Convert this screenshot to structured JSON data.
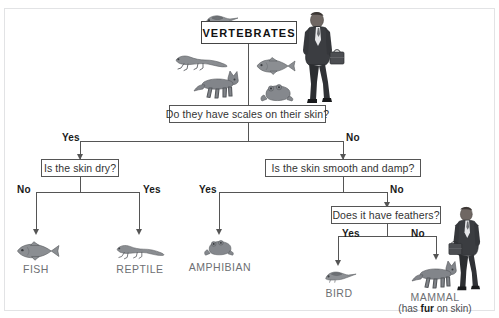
{
  "page": {
    "top_cut_text": "",
    "background_color": "#ffffff",
    "frame_color": "#e2e3e5"
  },
  "diagram": {
    "type": "decision-tree",
    "root": {
      "label": "VERTEBRATES"
    },
    "questions": [
      {
        "id": "q-scales",
        "text": "Do they have scales on their skin?"
      },
      {
        "id": "q-dry",
        "text": "Is the skin dry?"
      },
      {
        "id": "q-smooth",
        "text": "Is the skin smooth and damp?"
      },
      {
        "id": "q-feathers",
        "text": "Does it have feathers?"
      }
    ],
    "edges": [
      {
        "id": "e-scales-yes",
        "label": "Yes",
        "from": "q-scales",
        "to": "q-dry"
      },
      {
        "id": "e-scales-no",
        "label": "No",
        "from": "q-scales",
        "to": "q-smooth"
      },
      {
        "id": "e-dry-no",
        "label": "No",
        "from": "q-dry",
        "to": "leaf-fish"
      },
      {
        "id": "e-dry-yes",
        "label": "Yes",
        "from": "q-dry",
        "to": "leaf-reptile"
      },
      {
        "id": "e-smooth-yes",
        "label": "Yes",
        "from": "q-smooth",
        "to": "leaf-amphibian"
      },
      {
        "id": "e-smooth-no",
        "label": "No",
        "from": "q-smooth",
        "to": "q-feathers"
      },
      {
        "id": "e-feathers-yes",
        "label": "Yes",
        "from": "q-feathers",
        "to": "leaf-bird"
      },
      {
        "id": "e-feathers-no",
        "label": "No",
        "from": "q-feathers",
        "to": "leaf-mammal"
      }
    ],
    "leaves": [
      {
        "id": "leaf-fish",
        "label": "FISH",
        "note": "",
        "icon": "fish-illustration"
      },
      {
        "id": "leaf-reptile",
        "label": "REPTILE",
        "note": "",
        "icon": "lizard-illustration"
      },
      {
        "id": "leaf-amphibian",
        "label": "AMPHIBIAN",
        "note": "",
        "icon": "frog-illustration"
      },
      {
        "id": "leaf-bird",
        "label": "BIRD",
        "note": "",
        "icon": "bird-illustration"
      },
      {
        "id": "leaf-mammal",
        "label": "MAMMAL",
        "note_prefix": "(has ",
        "note_bold": "fur",
        "note_suffix": " on skin)",
        "icon": "fox-illustration"
      }
    ],
    "decorative_art": [
      {
        "id": "art-root-bird",
        "icon": "bird-illustration"
      },
      {
        "id": "art-root-lizard",
        "icon": "lizard-illustration"
      },
      {
        "id": "art-root-fox",
        "icon": "fox-illustration"
      },
      {
        "id": "art-root-fish",
        "icon": "fish-illustration"
      },
      {
        "id": "art-root-frog",
        "icon": "frog-illustration"
      },
      {
        "id": "art-root-man",
        "icon": "businessman-illustration"
      },
      {
        "id": "art-mammal-man",
        "icon": "businessman-illustration"
      }
    ]
  }
}
